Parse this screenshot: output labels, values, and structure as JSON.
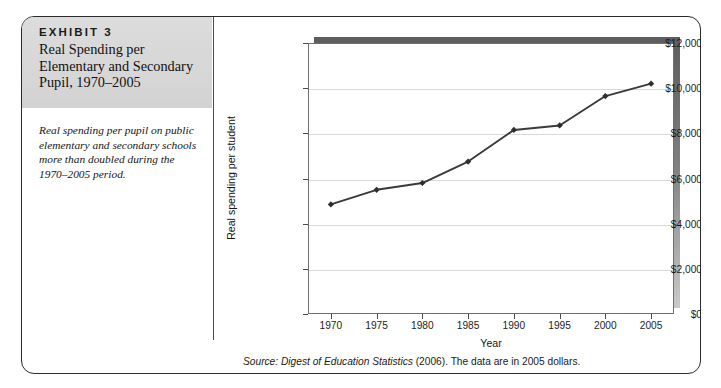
{
  "exhibit": {
    "label": "EXHIBIT 3",
    "title": "Real Spending per Elementary and Secondary Pupil, 1970–2005",
    "caption": "Real spending per pupil on public elementary and secondary schools more than doubled during the 1970–2005 period.",
    "source_prefix": "Source: ",
    "source_italic": "Digest of Education Statistics",
    "source_suffix": " (2006). The data are in 2005 dollars.",
    "header_bg": "#d8d8d8",
    "border_color": "#2b2b2b"
  },
  "chart_data": {
    "type": "line",
    "title": "",
    "xlabel": "Year",
    "ylabel": "Real spending per student",
    "x": [
      1970,
      1975,
      1980,
      1985,
      1990,
      1995,
      2000,
      2005
    ],
    "xtick_labels": [
      "1970",
      "1975",
      "1980",
      "1985",
      "1990",
      "1995",
      "2000",
      "2005"
    ],
    "values": [
      4850,
      5500,
      5800,
      6750,
      8150,
      8350,
      9650,
      10200
    ],
    "ytick_values": [
      0,
      2000,
      4000,
      6000,
      8000,
      10000,
      12000
    ],
    "ytick_labels": [
      "$0",
      "$2,000",
      "$4,000",
      "$6,000",
      "$8,000",
      "$10,000",
      "$12,000"
    ],
    "ylim": [
      0,
      12000
    ],
    "xlim": [
      1967.5,
      2007.5
    ],
    "grid": true,
    "legend": "none",
    "series_color": "#3a3a3a",
    "marker": "diamond",
    "marker_color": "#2e2e2e",
    "gridline_color": "#d9d9d9",
    "plot_shadow_color": "#7d7d7d"
  }
}
